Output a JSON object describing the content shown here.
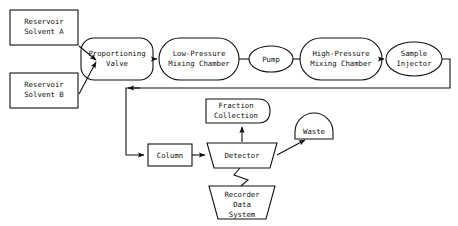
{
  "diagram": {
    "stroke_color": "#111111",
    "fill_color": "#ffffff",
    "background": "#ffffff",
    "nodes": {
      "reservoir_a": {
        "line1": "Reservoir",
        "line2": "Solvent A",
        "shape": "rectangle"
      },
      "reservoir_b": {
        "line1": "Reservoir",
        "line2": "Solvent B",
        "shape": "rectangle"
      },
      "proportioning_valve": {
        "line1": "Proportioning",
        "line2": "Valve",
        "shape": "rounded-rectangle"
      },
      "low_pressure_mixing_chamber": {
        "line1": "Low-Pressure",
        "line2": "Mixing Chamber",
        "shape": "stadium"
      },
      "pump": {
        "line1": "Pump",
        "line2": "",
        "shape": "ellipse"
      },
      "high_pressure_mixing_chamber": {
        "line1": "High-Pressure",
        "line2": "Mixing Chamber",
        "shape": "stadium"
      },
      "sample_injector": {
        "line1": "Sample",
        "line2": "Injector",
        "shape": "ellipse"
      },
      "column": {
        "line1": "Column",
        "line2": "",
        "shape": "rectangle"
      },
      "detector": {
        "line1": "Detector",
        "line2": "",
        "shape": "trapezoid-inverted"
      },
      "fraction_collection": {
        "line1": "Fraction",
        "line2": "Collection",
        "shape": "rounded-right-rectangle"
      },
      "waste": {
        "line1": "Waste",
        "line2": "",
        "shape": "dome"
      },
      "recorder_data_system": {
        "line1": "Recorder",
        "line2": "Data",
        "line3": "System",
        "shape": "trapezoid"
      }
    },
    "connectors": [
      {
        "from": "reservoir_a",
        "to": "proportioning_valve",
        "style": "arrow-diagonal"
      },
      {
        "from": "reservoir_b",
        "to": "proportioning_valve",
        "style": "arrow-diagonal"
      },
      {
        "from": "proportioning_valve",
        "to": "low_pressure_mixing_chamber",
        "style": "arrow-horizontal"
      },
      {
        "from": "low_pressure_mixing_chamber",
        "to": "pump",
        "style": "line-horizontal"
      },
      {
        "from": "pump",
        "to": "high_pressure_mixing_chamber",
        "style": "line-horizontal"
      },
      {
        "from": "high_pressure_mixing_chamber",
        "to": "sample_injector",
        "style": "arrow-horizontal"
      },
      {
        "from": "sample_injector",
        "to": "column",
        "style": "arrow-routed-loop"
      },
      {
        "from": "column",
        "to": "detector",
        "style": "arrow-horizontal"
      },
      {
        "from": "detector",
        "to": "fraction_collection",
        "style": "arrow-vertical-up"
      },
      {
        "from": "detector",
        "to": "waste",
        "style": "arrow-diagonal-up"
      },
      {
        "from": "detector",
        "to": "recorder_data_system",
        "style": "zigzag"
      }
    ]
  }
}
